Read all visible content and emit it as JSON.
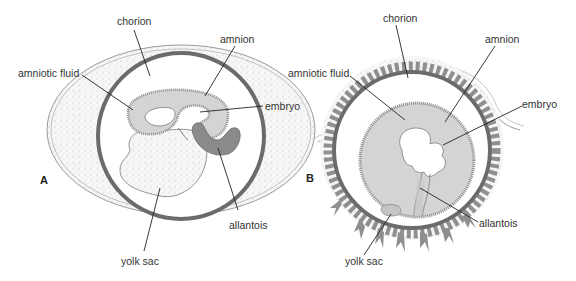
{
  "panels": [
    {
      "id": "A",
      "letter": "A",
      "labels": {
        "chorion": "chorion",
        "amnion": "amnion",
        "amniotic_fluid": "amniotic fluid",
        "embryo": "embryo",
        "allantois": "allantois",
        "yolk_sac": "yolk sac"
      }
    },
    {
      "id": "B",
      "letter": "B",
      "labels": {
        "chorion": "chorion",
        "amnion": "amnion",
        "amniotic_fluid": "amniotic fluid",
        "embryo": "embryo",
        "allantois": "allantois",
        "yolk_sac": "yolk sac"
      }
    }
  ],
  "colors": {
    "chorion": "#6b6b6b",
    "amniotic_fluid": "#d4d4d4",
    "allantois": "#8a8a8a",
    "villi": "#8f8f8f",
    "stipple": "#f1f1f1",
    "leader": "#222222"
  }
}
